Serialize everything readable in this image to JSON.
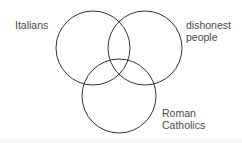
{
  "diagram": {
    "type": "venn",
    "background": "#ffffff",
    "stroke_color": "#333333",
    "text_color": "#4a4a4a",
    "sets": [
      {
        "id": "italians",
        "label_lines": [
          "Italians"
        ],
        "circle": {
          "cx": 93,
          "cy": 48,
          "r": 37
        }
      },
      {
        "id": "dishonest",
        "label_lines": [
          "dishonest",
          "people"
        ],
        "circle": {
          "cx": 145,
          "cy": 48,
          "r": 37
        }
      },
      {
        "id": "catholics",
        "label_lines": [
          "Roman",
          "Catholics"
        ],
        "circle": {
          "cx": 119,
          "cy": 96,
          "r": 37
        }
      }
    ]
  }
}
